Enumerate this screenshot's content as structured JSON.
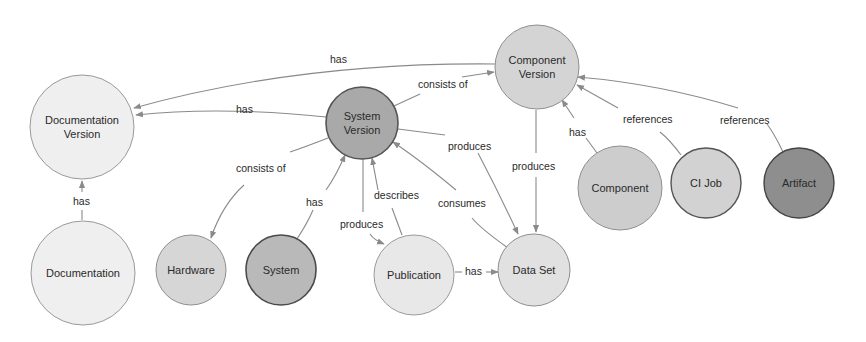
{
  "colors": {
    "edge": "#8a8a8a",
    "text": "#2a2a2a",
    "background": "#ffffff"
  },
  "nodes": [
    {
      "id": "documentation_version",
      "lines": [
        "Documentation",
        "Version"
      ],
      "cx": 82,
      "cy": 127,
      "r": 52,
      "fill": "#efefef",
      "stroke": "#9a9a9a",
      "stroke_width": 1
    },
    {
      "id": "component_version",
      "lines": [
        "Component",
        "Version"
      ],
      "cx": 537,
      "cy": 67,
      "r": 42,
      "fill": "#d4d4d4",
      "stroke": "#8f8f8f",
      "stroke_width": 1
    },
    {
      "id": "system_version",
      "lines": [
        "System",
        "Version"
      ],
      "cx": 362,
      "cy": 123,
      "r": 36,
      "fill": "#a9a9a9",
      "stroke": "#555555",
      "stroke_width": 1.6
    },
    {
      "id": "documentation",
      "lines": [
        "Documentation"
      ],
      "cx": 83,
      "cy": 273,
      "r": 52,
      "fill": "#efefef",
      "stroke": "#9a9a9a",
      "stroke_width": 1
    },
    {
      "id": "hardware",
      "lines": [
        "Hardware"
      ],
      "cx": 191,
      "cy": 270,
      "r": 35,
      "fill": "#d6d6d6",
      "stroke": "#8f8f8f",
      "stroke_width": 1
    },
    {
      "id": "system",
      "lines": [
        "System"
      ],
      "cx": 281,
      "cy": 270,
      "r": 35,
      "fill": "#b9b9b9",
      "stroke": "#4a4a4a",
      "stroke_width": 1.6
    },
    {
      "id": "publication",
      "lines": [
        "Publication"
      ],
      "cx": 414,
      "cy": 275,
      "r": 40,
      "fill": "#e8e8e8",
      "stroke": "#9a9a9a",
      "stroke_width": 1
    },
    {
      "id": "data_set",
      "lines": [
        "Data Set"
      ],
      "cx": 534,
      "cy": 270,
      "r": 36,
      "fill": "#e1e1e1",
      "stroke": "#8f8f8f",
      "stroke_width": 1
    },
    {
      "id": "component",
      "lines": [
        "Component"
      ],
      "cx": 620,
      "cy": 188,
      "r": 42,
      "fill": "#cdcdcd",
      "stroke": "#8f8f8f",
      "stroke_width": 1
    },
    {
      "id": "ci_job",
      "lines": [
        "CI Job"
      ],
      "cx": 706,
      "cy": 183,
      "r": 35,
      "fill": "#d2d2d2",
      "stroke": "#555555",
      "stroke_width": 1.4
    },
    {
      "id": "artifact",
      "lines": [
        "Artifact"
      ],
      "cx": 799,
      "cy": 183,
      "r": 35,
      "fill": "#8e8e8e",
      "stroke": "#444444",
      "stroke_width": 1.4
    }
  ],
  "edges": [
    {
      "from": "component_version",
      "to": "documentation_version",
      "label": "has",
      "path": "M495,64 Q300,62 134,108",
      "label_x": 330,
      "label_y": 63
    },
    {
      "from": "system_version",
      "to": "documentation_version",
      "label": "has",
      "path": "M326,117 Q220,106 136,115",
      "label_x": 236,
      "label_y": 113
    },
    {
      "from": "system_version",
      "to": "component_version",
      "label": "consists of",
      "path": "M394,106 L420,94 M462,77 L494,72",
      "label_x": 418,
      "label_y": 88
    },
    {
      "from": "system_version",
      "to": "data_set",
      "label": "produces",
      "path": "M398,129 L445,135 M478,153 Q500,195 518,234",
      "label_x": 448,
      "label_y": 150
    },
    {
      "from": "component_version",
      "to": "data_set",
      "label": "produces",
      "path": "M536,110 L536,153 M536,177 L536,232",
      "label_x": 512,
      "label_y": 170
    },
    {
      "from": "data_set",
      "to": "system_version",
      "label": "consumes",
      "path": "M508,248 Q480,228 472,218 M456,190 Q420,160 393,142",
      "label_x": 438,
      "label_y": 207
    },
    {
      "from": "system_version",
      "to": "hardware",
      "label": "consists of",
      "path": "M328,138 Q305,147 290,152 M244,185 Q222,205 211,238",
      "label_x": 236,
      "label_y": 172
    },
    {
      "from": "system",
      "to": "system_version",
      "label": "has",
      "path": "M297,239 Q308,222 313,210 M326,190 Q336,176 345,155",
      "label_x": 306,
      "label_y": 206
    },
    {
      "from": "system_version",
      "to": "publication",
      "label": "produces",
      "path": "M363,159 L363,212 M370,234 Q374,240 384,244",
      "label_x": 340,
      "label_y": 228
    },
    {
      "from": "publication",
      "to": "system_version",
      "label": "describes",
      "path": "M402,235 L392,208 M378,190 L372,158",
      "label_x": 374,
      "label_y": 199
    },
    {
      "from": "publication",
      "to": "data_set",
      "label": "has",
      "path": "M455,272 L462,272 M486,272 L498,272",
      "label_x": 465,
      "label_y": 275
    },
    {
      "from": "component",
      "to": "component_version",
      "label": "has",
      "path": "M597,153 L586,138 M574,118 L562,100",
      "label_x": 569,
      "label_y": 136
    },
    {
      "from": "ci_job",
      "to": "component_version",
      "label": "references",
      "path": "M681,155 Q670,140 660,132 M618,108 L577,85",
      "label_x": 623,
      "label_y": 123
    },
    {
      "from": "artifact",
      "to": "component_version",
      "label": "references",
      "path": "M783,152 Q775,135 767,124 M738,108 Q660,84 578,77",
      "label_x": 720,
      "label_y": 124
    },
    {
      "from": "documentation",
      "to": "documentation_version",
      "label": "has",
      "path": "M82,220 L82,210 M82,192 L82,181",
      "label_x": 73,
      "label_y": 205
    }
  ]
}
